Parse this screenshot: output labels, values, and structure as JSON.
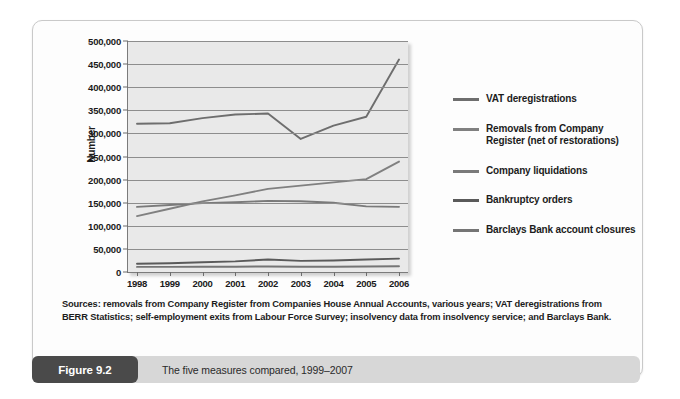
{
  "figure": {
    "badge_label": "Figure 9.2",
    "caption": "The five measures compared, 1999–2007",
    "sources": "Sources: removals from Company Register from Companies House Annual Accounts, various years; VAT deregistrations from BERR Statistics; self-employment exits from Labour Force Survey; insolvency data from insolvency service; and Barclays Bank."
  },
  "colors": {
    "plot_background": "#e9e9e9",
    "gridline": "#8d8d8d",
    "axis": "#7b7b7b",
    "panel_background": "#fdfdfd",
    "caption_bar": "#d7d7d7",
    "badge_background": "#4a4a4a",
    "series_vat_deregistrations": "#6e6e6e",
    "series_removals": "#808080",
    "series_company_liquidations": "#7a7a7a",
    "series_bankruptcy_orders": "#5a5a5a",
    "series_barclays": "#757575"
  },
  "chart_data": {
    "type": "line",
    "title": "",
    "xlabel": "",
    "ylabel": "Number",
    "ylim": [
      0,
      500000
    ],
    "ytick_labels": [
      "500,000",
      "450,000",
      "400,000",
      "350,000",
      "300,000",
      "250,000",
      "200,000",
      "150,000",
      "100,000",
      "50,000",
      "0"
    ],
    "ytick_values": [
      500000,
      450000,
      400000,
      350000,
      300000,
      250000,
      200000,
      150000,
      100000,
      50000,
      0
    ],
    "grid": true,
    "legend_position": "right",
    "categories": [
      "1998",
      "1999",
      "2000",
      "2001",
      "2002",
      "2003",
      "2004",
      "2005",
      "2006"
    ],
    "x": [
      1998,
      1999,
      2000,
      2001,
      2002,
      2003,
      2004,
      2005,
      2006
    ],
    "series": [
      {
        "name": "VAT deregistrations",
        "color": "#6e6e6e",
        "values": [
          321000,
          322000,
          333000,
          341000,
          343000,
          288000,
          317000,
          336000,
          460000
        ]
      },
      {
        "name": "Removals from Company Register (net of restorations)",
        "color": "#808080",
        "values": [
          121000,
          137000,
          153000,
          166000,
          180000,
          187000,
          194000,
          201000,
          239000
        ]
      },
      {
        "name": "Company liquidations",
        "color": "#7a7a7a",
        "values": [
          141000,
          145000,
          149000,
          151000,
          154000,
          153000,
          150000,
          142000,
          141000
        ]
      },
      {
        "name": "Bankruptcy orders",
        "color": "#5a5a5a",
        "values": [
          18000,
          19000,
          21000,
          23000,
          27000,
          24000,
          25000,
          27000,
          29000
        ]
      },
      {
        "name": "Barclays Bank account closures",
        "color": "#757575",
        "values": [
          11000,
          11000,
          11500,
          11500,
          12000,
          11500,
          11500,
          12000,
          12500
        ]
      }
    ]
  },
  "legend": {
    "items": [
      {
        "label": "VAT deregistrations",
        "color": "#6e6e6e"
      },
      {
        "label": "Removals from Company Register (net of restorations)",
        "color": "#808080"
      },
      {
        "label": "Company liquidations",
        "color": "#7a7a7a"
      },
      {
        "label": "Bankruptcy orders",
        "color": "#5a5a5a"
      },
      {
        "label": "Barclays Bank account closures",
        "color": "#757575"
      }
    ]
  }
}
